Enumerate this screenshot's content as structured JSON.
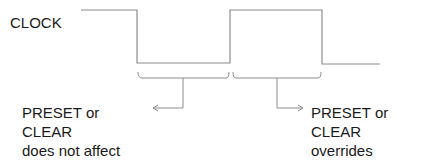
{
  "diagram": {
    "signal_label": "CLOCK",
    "left_annotation": [
      "PRESET or CLEAR",
      "does not affect",
      "clocking"
    ],
    "right_annotation": [
      "PRESET or CLEAR",
      "overrides",
      "clocking"
    ],
    "line_color": "#8c8c8c",
    "text_color": "#1a1a1a"
  }
}
